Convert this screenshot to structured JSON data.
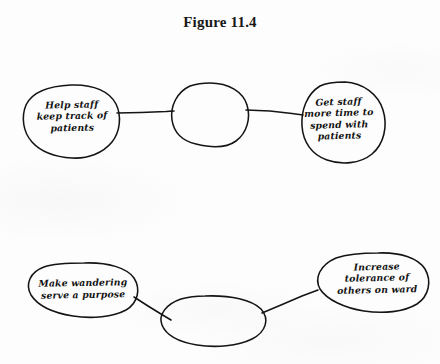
{
  "figure": {
    "title": "Figure 11.4",
    "type": "hand-drawn concept map",
    "ink_color": "#141414",
    "paper_color": "#fdfdfd"
  },
  "nodes": [
    {
      "id": "help-staff",
      "text": "Help staff\nkeep track of\npatients",
      "position": "top-left",
      "empty": false
    },
    {
      "id": "top-center",
      "text": "",
      "position": "top-center",
      "empty": true
    },
    {
      "id": "get-staff-time",
      "text": "Get staff\nmore time to\nspend with\npatients",
      "position": "top-right",
      "empty": false
    },
    {
      "id": "make-wandering",
      "text": "Make wandering\nserve a purpose",
      "position": "bottom-left",
      "empty": false
    },
    {
      "id": "bottom-center",
      "text": "",
      "position": "bottom-center",
      "empty": true
    },
    {
      "id": "increase-tolerance",
      "text": "Increase\ntolerance of\nothers on ward",
      "position": "bottom-right",
      "empty": false
    }
  ],
  "connectors": [
    {
      "from": "help-staff",
      "to": "top-center"
    },
    {
      "from": "top-center",
      "to": "get-staff-time"
    },
    {
      "from": "make-wandering",
      "to": "bottom-center"
    },
    {
      "from": "bottom-center",
      "to": "increase-tolerance"
    }
  ]
}
